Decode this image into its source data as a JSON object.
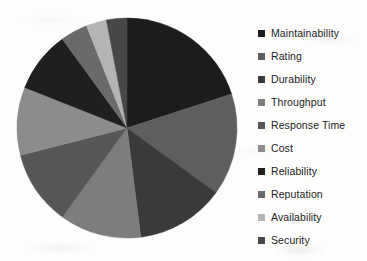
{
  "chart_data": {
    "type": "pie",
    "title": "",
    "legend_position": "right",
    "start_angle_deg": 0,
    "direction": "clockwise",
    "categories": [
      "Maintainability",
      "Rating",
      "Durability",
      "Throughput",
      "Response Time",
      "Cost",
      "Reliability",
      "Reputation",
      "Availability",
      "Security"
    ],
    "values": [
      20,
      15,
      13,
      12,
      11,
      10,
      9,
      4,
      3,
      3
    ],
    "units": "percent",
    "total": 100,
    "colors": [
      "#1c1c1c",
      "#5e5e5e",
      "#3a3a3a",
      "#7d7d7d",
      "#565656",
      "#8c8c8c",
      "#1f1f1f",
      "#6a6a6a",
      "#b4b4b4",
      "#474747"
    ],
    "slices": [
      {
        "label": "Maintainability",
        "value": 20,
        "color": "#1c1c1c"
      },
      {
        "label": "Rating",
        "value": 15,
        "color": "#5e5e5e"
      },
      {
        "label": "Durability",
        "value": 13,
        "color": "#3a3a3a"
      },
      {
        "label": "Throughput",
        "value": 12,
        "color": "#7d7d7d"
      },
      {
        "label": "Response Time",
        "value": 11,
        "color": "#565656"
      },
      {
        "label": "Cost",
        "value": 10,
        "color": "#8c8c8c"
      },
      {
        "label": "Reliability",
        "value": 9,
        "color": "#1f1f1f"
      },
      {
        "label": "Reputation",
        "value": 4,
        "color": "#6a6a6a"
      },
      {
        "label": "Availability",
        "value": 3,
        "color": "#b4b4b4"
      },
      {
        "label": "Security",
        "value": 3,
        "color": "#474747"
      }
    ],
    "geometry": {
      "center_x": 127,
      "center_y": 128,
      "radius": 110
    }
  },
  "legend": {
    "items": [
      {
        "label": "Maintainability",
        "color": "#1c1c1c"
      },
      {
        "label": "Rating",
        "color": "#5e5e5e"
      },
      {
        "label": "Durability",
        "color": "#3a3a3a"
      },
      {
        "label": "Throughput",
        "color": "#7d7d7d"
      },
      {
        "label": "Response Time",
        "color": "#565656"
      },
      {
        "label": "Cost",
        "color": "#8c8c8c"
      },
      {
        "label": "Reliability",
        "color": "#1f1f1f"
      },
      {
        "label": "Reputation",
        "color": "#6a6a6a"
      },
      {
        "label": "Availability",
        "color": "#b4b4b4"
      },
      {
        "label": "Security",
        "color": "#474747"
      }
    ]
  }
}
